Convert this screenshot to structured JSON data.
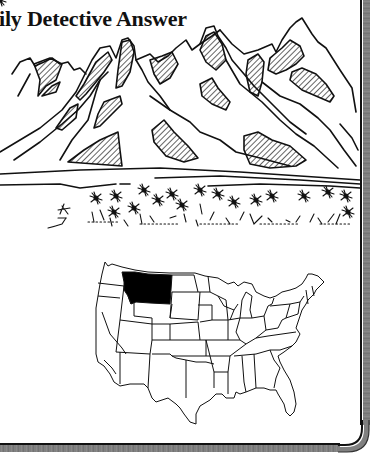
{
  "title": {
    "text": "Daily Detective Answer",
    "visible_text": "ily Detective Answer"
  },
  "illustration": {
    "subject": "mountain-range-with-wildflower-meadow",
    "style": "black-and-white line art with hatched shading"
  },
  "map": {
    "subject": "contiguous-united-states",
    "highlighted_state": "Montana",
    "highlight_color": "#000000",
    "base_color": "#ffffff",
    "outline_color": "#111111"
  },
  "frame": {
    "border_color": "#111111",
    "band_color": "#808080"
  }
}
